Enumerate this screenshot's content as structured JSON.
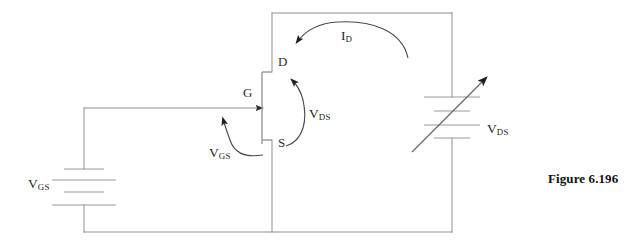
{
  "figure": {
    "caption": "Figure 6.196",
    "type": "circuit-schematic"
  },
  "labels": {
    "drain_terminal": "D",
    "gate_terminal": "G",
    "source_terminal": "S",
    "drain_current": {
      "symbol": "I",
      "subscript": "D"
    },
    "drain_source_voltage": {
      "symbol": "V",
      "subscript": "DS"
    },
    "gate_source_voltage": {
      "symbol": "V",
      "subscript": "GS"
    },
    "supply_voltage": {
      "symbol": "V",
      "subscript": "DS"
    },
    "gate_supply": {
      "symbol": "V",
      "subscript": "GS"
    }
  },
  "colors": {
    "wire": "#8a8a8a",
    "annotation": "#3a3a3a",
    "text": "#2b2b2b",
    "caption": "#111111",
    "background": "#ffffff"
  },
  "components": [
    {
      "name": "transistor",
      "kind": "jfet",
      "terminals": [
        "D",
        "G",
        "S"
      ]
    },
    {
      "name": "gate-source-battery",
      "kind": "battery",
      "cells": 2,
      "label": "V_GS"
    },
    {
      "name": "drain-supply",
      "kind": "variable-battery",
      "cells": 2,
      "label": "V_DS"
    }
  ],
  "annotations": [
    {
      "name": "drain-current-arrow",
      "label": "I_D",
      "direction": "clockwise-into-drain"
    },
    {
      "name": "drain-source-voltage-arrow",
      "label": "V_DS",
      "direction": "source-to-drain"
    },
    {
      "name": "gate-source-voltage-arrow",
      "label": "V_GS",
      "direction": "upward-to-gate"
    }
  ]
}
